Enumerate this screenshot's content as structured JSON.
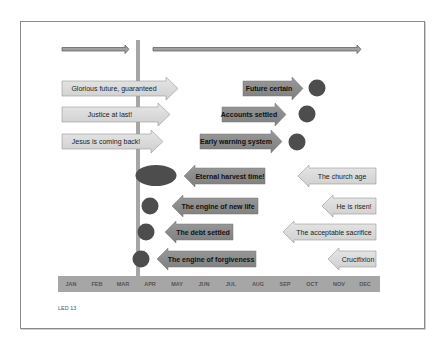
{
  "diagram": {
    "top_arrows": [
      {
        "name": "timeline-past-arrow",
        "from_month": "JAN",
        "to_month": "MAR"
      },
      {
        "name": "timeline-future-arrow",
        "from_month": "APR",
        "to_month": "OCT"
      }
    ],
    "divider_month": "APR",
    "future_arrows": [
      {
        "label": "Glorious future, guaranteed",
        "direction": "right"
      },
      {
        "label": "Justice at last!",
        "direction": "right"
      },
      {
        "label": "Jesus is coming back!",
        "direction": "right"
      }
    ],
    "mid_arrows": [
      {
        "label": "Future certain",
        "direction": "right"
      },
      {
        "label": "Accounts settled",
        "direction": "right"
      },
      {
        "label": "Early warning system",
        "direction": "right"
      }
    ],
    "engine_arrows": [
      {
        "label": "Eternal harvest time!",
        "direction": "left"
      },
      {
        "label": "The engine of new life",
        "direction": "left"
      },
      {
        "label": "The debt settled",
        "direction": "left"
      },
      {
        "label": "The engine of forgiveness",
        "direction": "left"
      }
    ],
    "event_arrows": [
      {
        "label": "The church age",
        "direction": "left"
      },
      {
        "label": "He is risen!",
        "direction": "left"
      },
      {
        "label": "The acceptable sacrifice",
        "direction": "left"
      },
      {
        "label": "Crucifixion",
        "direction": "left"
      }
    ],
    "months": [
      "JAN",
      "FEB",
      "MAR",
      "APR",
      "MAY",
      "JUN",
      "JUL",
      "AUG",
      "SEP",
      "OCT",
      "NOV",
      "DEC"
    ],
    "footer": "LED 13",
    "colors": {
      "light_arrow": "#d9d9d9",
      "dark_arrow": "#8c8c8c",
      "circle": "#4d4d4d",
      "bar": "#a6a6a6",
      "month_bar": "#a6a6a6"
    }
  }
}
